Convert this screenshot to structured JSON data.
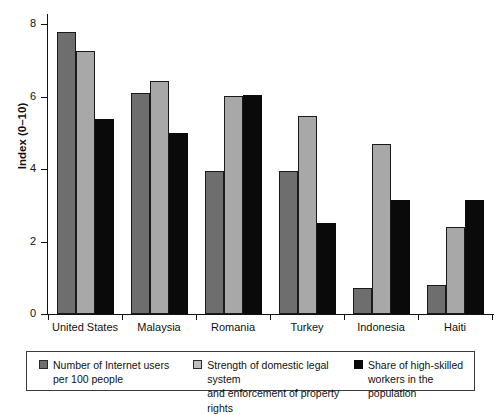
{
  "chart_data": {
    "type": "bar",
    "title": "",
    "subtitle": "",
    "xlabel": "",
    "ylabel": "Index (0–10)",
    "categories": [
      "United States",
      "Malaysia",
      "Romania",
      "Turkey",
      "Indonesia",
      "Haiti"
    ],
    "series": [
      {
        "name": "Number of Internet users per 100 people",
        "color": "#6e6e6e",
        "values": [
          7.78,
          6.1,
          3.94,
          3.94,
          0.72,
          0.8
        ]
      },
      {
        "name": "Strength of domestic legal system and enforcement of property rights",
        "color": "#a8a8a8",
        "values": [
          7.25,
          6.43,
          6.01,
          5.46,
          4.69,
          2.4
        ]
      },
      {
        "name": "Share of high-skilled workers in the population",
        "color": "#0a0a0a",
        "values": [
          5.38,
          4.99,
          6.05,
          2.51,
          3.14,
          3.14
        ]
      }
    ],
    "ylim": [
      0,
      8.3
    ],
    "yticks": [
      0,
      2,
      4,
      6,
      8
    ],
    "ytick_labels": [
      "0",
      "2",
      "4",
      "6",
      "8"
    ],
    "grid": false,
    "legend_position": "bottom"
  },
  "legend": {
    "entries": [
      {
        "line1": "Number of Internet users",
        "line2": "per 100 people",
        "swatch": "dark-gray-swatch"
      },
      {
        "line1": "Strength of domestic legal system",
        "line2": "and enforcement of property rights",
        "swatch": "light-gray-swatch"
      },
      {
        "line1": "Share of high-skilled",
        "line2": "workers in the population",
        "swatch": "black-swatch"
      }
    ]
  },
  "colors": {
    "series_dark_gray": "#6e6e6e",
    "series_light_gray": "#a8a8a8",
    "series_black": "#0a0a0a",
    "axis": "#111111",
    "background": "#ffffff"
  }
}
